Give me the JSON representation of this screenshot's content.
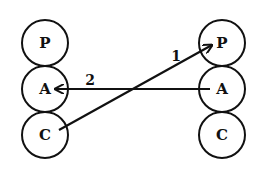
{
  "diagram": {
    "left_column": [
      {
        "label": "P",
        "cx": 45,
        "cy": 43
      },
      {
        "label": "A",
        "cx": 45,
        "cy": 89
      },
      {
        "label": "C",
        "cx": 45,
        "cy": 135
      }
    ],
    "right_column": [
      {
        "label": "P",
        "cx": 222,
        "cy": 43
      },
      {
        "label": "A",
        "cx": 222,
        "cy": 89
      },
      {
        "label": "C",
        "cx": 222,
        "cy": 135
      }
    ],
    "radius": 23,
    "arrows": [
      {
        "label": "1",
        "from": "left C",
        "to": "right P",
        "x1": 59,
        "y1": 130,
        "x2": 212,
        "y2": 45,
        "label_x": 176,
        "label_y": 56
      },
      {
        "label": "2",
        "from": "right A",
        "to": "left A",
        "x1": 210,
        "y1": 89,
        "x2": 55,
        "y2": 89,
        "label_x": 90,
        "label_y": 82
      }
    ],
    "color": "#111111"
  }
}
